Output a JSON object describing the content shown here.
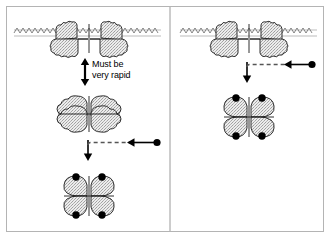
{
  "figure": {
    "frame": {
      "border_color": "#b4b4b4",
      "background": "#ffffff"
    },
    "divider": {
      "orientation": "vertical",
      "color": "#9a9a9a",
      "x": 170
    }
  },
  "colors": {
    "outline": "#1a1a1a",
    "stipple_fill": "#e2e2e2",
    "stipple_dot": "#9b9b9b",
    "membrane": "#6f6f6f",
    "ligand_dot": "#000000",
    "arrow": "#000000",
    "dashed_line": "#555555",
    "frame_border": "#b4b4b4",
    "text": "#000000"
  },
  "annotations": {
    "must_be_rapid_line1": "Must be",
    "must_be_rapid_line2": "very rapid"
  },
  "panels": [
    {
      "id": "left-panel",
      "name": "left-panel",
      "steps": [
        {
          "id": "left-membrane-receptor",
          "label": "membrane-bound receptor dimer",
          "icon": "membrane-receptor-dimer"
        },
        {
          "id": "left-equilibrium-arrow",
          "label": "reversible equilibrium double arrow",
          "icon": "double-headed-vertical-arrow"
        },
        {
          "id": "left-free-dimer",
          "label": "free receptor dimer four lobed",
          "icon": "four-lobe-dimer"
        },
        {
          "id": "left-ligand-binding-arrow",
          "label": "ligand binding arrow with dashed input",
          "icon": "down-arrow-with-dashed-ligand-arrow"
        },
        {
          "id": "left-bound-complex",
          "label": "ligand bound receptor complex with four ligands",
          "icon": "four-lobe-dimer-with-ligands"
        }
      ]
    },
    {
      "id": "right-panel",
      "name": "right-panel",
      "steps": [
        {
          "id": "right-membrane-receptor",
          "label": "membrane-bound receptor dimer",
          "icon": "membrane-receptor-dimer"
        },
        {
          "id": "right-ligand-binding-arrow",
          "label": "ligand binding arrow with dashed input",
          "icon": "down-arrow-with-dashed-ligand-arrow"
        },
        {
          "id": "right-bound-complex",
          "label": "ligand bound receptor complex with four ligands",
          "icon": "four-lobe-dimer-with-ligands"
        }
      ]
    }
  ],
  "legend_symbols": {
    "ligand": "filled-black-circle",
    "receptor_subunit": "stippled-lobe",
    "membrane": "zigzag-wave-line"
  }
}
